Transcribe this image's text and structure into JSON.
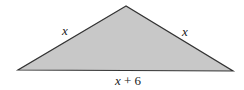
{
  "diagram": {
    "type": "isosceles-triangle",
    "fill_color": "#c8c8c8",
    "stroke_color": "#333333",
    "vertices": {
      "apex": [
        126,
        6
      ],
      "left": [
        18,
        70
      ],
      "right": [
        233,
        71
      ]
    },
    "labels": {
      "left_side": "x",
      "right_side": "x",
      "base": "x + 6"
    }
  }
}
